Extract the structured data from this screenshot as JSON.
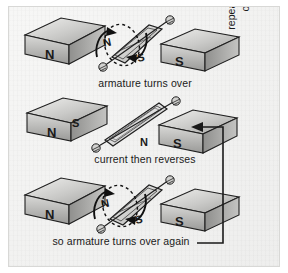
{
  "figure": {
    "background_color": "#f2f2f1",
    "border_color": "#d8d8d6",
    "ink_color": "#1a1a1a"
  },
  "panels": [
    {
      "id": "panel-1",
      "caption": "armature turns over",
      "left_magnet_label": "N",
      "right_magnet_label": "S",
      "armature_pole_top": "N",
      "armature_pole_bottom": "S",
      "armature_state": "tilted",
      "rotation_arrows": true
    },
    {
      "id": "panel-2",
      "caption": "current then reverses",
      "left_magnet_label": "N",
      "right_magnet_label": "S",
      "armature_pole_top": "S",
      "armature_pole_bottom": "N",
      "armature_state": "flat",
      "rotation_arrows": false
    },
    {
      "id": "panel-3",
      "caption": "so armature turns over again",
      "left_magnet_label": "N",
      "right_magnet_label": "S",
      "armature_pole_top": "N",
      "armature_pole_bottom": "S",
      "armature_state": "tilted",
      "rotation_arrows": true
    }
  ],
  "feedback_loop": {
    "line_1": "repeated over and",
    "line_2": "over again",
    "arrow_direction": "left",
    "arrow_target": "panel-2"
  },
  "colors": {
    "magnet_light": "#e6e6e4",
    "magnet_mid": "#bdbdbb",
    "magnet_dark": "#8e8e8c",
    "outline": "#1f1f1f",
    "coil_fill": "#dcdcda"
  }
}
